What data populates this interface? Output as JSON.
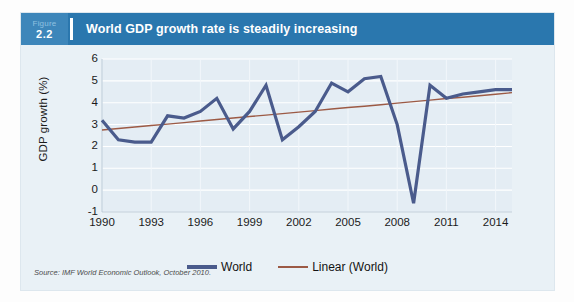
{
  "figure": {
    "tag_word": "Figure",
    "tag_number": "2.2",
    "title": "World GDP growth rate is steadily increasing",
    "source": "Source: IMF World Economic Outlook, October 2010.",
    "colors": {
      "header_blue": "#2a77ae",
      "tag_blue": "#3d86ba",
      "card_bg": "#e9f1f6",
      "series_world": "#4a5b8c",
      "series_linear": "#9c5a45",
      "gridline": "#ffffff"
    }
  },
  "chart_data": {
    "type": "line",
    "title": "World GDP growth rate is steadily increasing",
    "xlabel": "",
    "ylabel": "GDP growth (%)",
    "xlim": [
      1990,
      2015
    ],
    "ylim": [
      -1,
      6
    ],
    "yticks": [
      6,
      5,
      4,
      3,
      2,
      1,
      0,
      -1
    ],
    "xticks": [
      1990,
      1993,
      1996,
      1999,
      2002,
      2005,
      2008,
      2011,
      2014
    ],
    "grid": true,
    "legend_position": "bottom-center",
    "x": [
      1990,
      1991,
      1992,
      1993,
      1994,
      1995,
      1996,
      1997,
      1998,
      1999,
      2000,
      2001,
      2002,
      2003,
      2004,
      2005,
      2006,
      2007,
      2008,
      2009,
      2010,
      2011,
      2012,
      2013,
      2014,
      2015
    ],
    "series": [
      {
        "name": "World",
        "values": [
          3.2,
          2.3,
          2.2,
          2.2,
          3.4,
          3.3,
          3.6,
          4.2,
          2.8,
          3.6,
          4.8,
          2.3,
          2.9,
          3.6,
          4.9,
          4.5,
          5.1,
          5.2,
          3.0,
          -0.6,
          4.8,
          4.2,
          4.4,
          4.5,
          4.6,
          4.6
        ]
      },
      {
        "name": "Linear (World)",
        "values": [
          2.75,
          2.82,
          2.89,
          2.96,
          3.02,
          3.09,
          3.16,
          3.23,
          3.3,
          3.37,
          3.43,
          3.5,
          3.57,
          3.64,
          3.71,
          3.78,
          3.84,
          3.91,
          3.98,
          4.05,
          4.12,
          4.19,
          4.25,
          4.32,
          4.39,
          4.46
        ]
      }
    ]
  },
  "legend": {
    "items": [
      {
        "label": "World"
      },
      {
        "label": "Linear (World)"
      }
    ]
  }
}
